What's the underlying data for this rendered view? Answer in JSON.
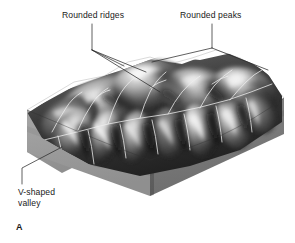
{
  "figure": {
    "panel_letter": "A",
    "kind": "geologic-block-diagram",
    "background_color": "#ffffff"
  },
  "labels": {
    "rounded_ridges": "Rounded ridges",
    "rounded_peaks": "Rounded peaks",
    "v_shaped_valley": "V-shaped\nvalley"
  },
  "colors": {
    "ink": "#1a1a1a",
    "leader_line": "#2b2b2b",
    "block_left_face": "#9a9a9a",
    "block_right_face": "#7b7b7b",
    "block_top_edge": "#b4b4b4",
    "terrain_light": "#f2f2f2",
    "terrain_mid": "#8d8d8d",
    "terrain_dark": "#1c1c1c",
    "stream_line": "#ededed"
  },
  "annotations": [
    {
      "name": "rounded-ridges-callout",
      "text": "Rounded ridges",
      "leader_targets": 3
    },
    {
      "name": "rounded-peaks-callout",
      "text": "Rounded peaks",
      "leader_targets": 2
    },
    {
      "name": "v-shaped-valley-callout",
      "text": "V-shaped valley",
      "leader_targets": 1
    }
  ]
}
